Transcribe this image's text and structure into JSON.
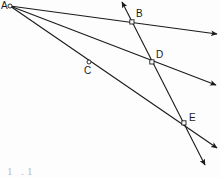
{
  "figure": {
    "background_color": "#fdfdfd",
    "stroke_color": "#1a1a1a",
    "label_color": "#1a1a1a",
    "width": 220,
    "height": 178,
    "caption": "1 .1"
  },
  "points": [
    {
      "id": "A",
      "label": "A",
      "x": 10,
      "y": 6,
      "label_x": 1,
      "label_y": 1,
      "marker": "open-circle"
    },
    {
      "id": "B",
      "label": "B",
      "x": 132,
      "y": 22,
      "label_x": 136,
      "label_y": 9,
      "marker": "open-square"
    },
    {
      "id": "C",
      "label": "C",
      "x": 89,
      "y": 62,
      "label_x": 84,
      "label_y": 66,
      "marker": "open-circle"
    },
    {
      "id": "D",
      "label": "D",
      "x": 152,
      "y": 62,
      "label_x": 156,
      "label_y": 50,
      "marker": "open-square"
    },
    {
      "id": "E",
      "label": "E",
      "x": 184,
      "y": 123,
      "label_x": 189,
      "label_y": 113,
      "marker": "open-square"
    }
  ],
  "rays": [
    {
      "id": "ray-A-B",
      "from": "A",
      "through": [
        "B"
      ],
      "x1": 10,
      "y1": 6,
      "x2": 217,
      "y2": 34,
      "arrow_end": true
    },
    {
      "id": "ray-A-D",
      "from": "A",
      "through": [
        "D"
      ],
      "x1": 10,
      "y1": 6,
      "x2": 216,
      "y2": 85,
      "arrow_end": true
    },
    {
      "id": "ray-A-C-E",
      "from": "A",
      "through": [
        "C",
        "E"
      ],
      "x1": 10,
      "y1": 6,
      "x2": 217,
      "y2": 148,
      "arrow_end": true
    }
  ],
  "transversal": {
    "id": "transversal-B-D-E",
    "through": [
      "B",
      "D",
      "E"
    ],
    "x1": 122,
    "y1": 2,
    "x2": 205,
    "y2": 165,
    "arrow_start": true,
    "arrow_end": true
  }
}
